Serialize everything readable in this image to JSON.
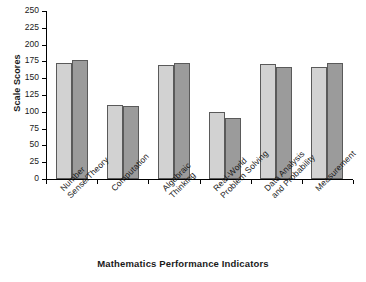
{
  "chart_data": {
    "type": "bar",
    "title": "",
    "xlabel": "Mathematics Performance Indicators",
    "ylabel": "Scale Scores",
    "ylim": [
      0,
      250
    ],
    "ytick_labels": [
      "250",
      "225",
      "200",
      "175",
      "150",
      "125",
      "100",
      "75",
      "50",
      "25",
      "0"
    ],
    "ytick_values": [
      250,
      225,
      200,
      175,
      150,
      125,
      100,
      75,
      50,
      25,
      0
    ],
    "grid": false,
    "legend": "none",
    "categories": [
      "Number\nSense/Theory",
      "Computation",
      "Algebraic\nThinking",
      "Real-World\nProblem Solving",
      "Data Analysis\nand Probability",
      "Measurement"
    ],
    "series": [
      {
        "name": "series-1",
        "color": "#d2d2d2",
        "values": [
          173,
          110,
          170,
          100,
          171,
          167
        ]
      },
      {
        "name": "series-2",
        "color": "#9b9b9b",
        "values": [
          177,
          108,
          173,
          91,
          167,
          173
        ]
      }
    ]
  }
}
